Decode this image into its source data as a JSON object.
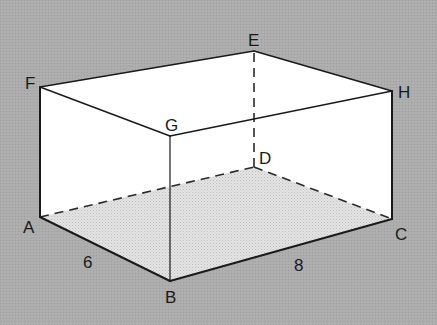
{
  "figure": {
    "type": "rectangular-prism",
    "background_color": "#aaaaaa",
    "face_color": "#ffffff",
    "floor_color": "#dcdcdc",
    "line_color": "#1a1a1a"
  },
  "vertices": {
    "A": {
      "label": "A",
      "x": 40,
      "y": 217
    },
    "B": {
      "label": "B",
      "x": 170,
      "y": 281
    },
    "C": {
      "label": "C",
      "x": 392,
      "y": 219
    },
    "D": {
      "label": "D",
      "x": 254,
      "y": 167
    },
    "E": {
      "label": "E",
      "x": 254,
      "y": 51
    },
    "F": {
      "label": "F",
      "x": 40,
      "y": 87
    },
    "G": {
      "label": "G",
      "x": 170,
      "y": 136
    },
    "H": {
      "label": "H",
      "x": 392,
      "y": 91
    }
  },
  "edge_labels": {
    "AB": "6",
    "BC": "8"
  },
  "hidden_edges": [
    "AD",
    "DC",
    "DE"
  ]
}
